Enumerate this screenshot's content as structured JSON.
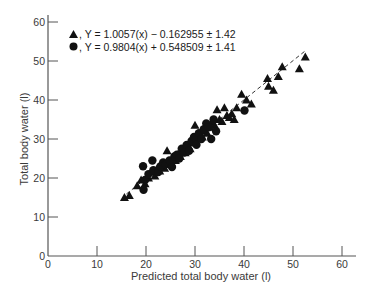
{
  "chart_data": {
    "type": "scatter",
    "title": "",
    "xlabel": "Predicted total body water (l)",
    "ylabel": "Total body water (l)",
    "xlim": [
      0,
      60
    ],
    "ylim": [
      0,
      60
    ],
    "xticks": [
      0,
      10,
      20,
      30,
      40,
      50,
      60
    ],
    "yticks": [
      0,
      10,
      20,
      30,
      40,
      50,
      60
    ],
    "grid": false,
    "legend_position": "upper-left",
    "colors": {
      "marker": "#111111",
      "axis": "#555555",
      "text": "#3a3a3a"
    },
    "series": [
      {
        "name": "Y = 1.0057(x) − 0.162955 ± 1.42",
        "marker": "triangle",
        "equation": {
          "slope": 1.0057,
          "intercept": -0.162955,
          "se": 1.42
        },
        "points": [
          [
            15.6,
            15.0
          ],
          [
            16.6,
            15.5
          ],
          [
            18.2,
            18.0
          ],
          [
            19.0,
            19.5
          ],
          [
            19.8,
            18.5
          ],
          [
            20.5,
            20.0
          ],
          [
            21.0,
            21.5
          ],
          [
            21.8,
            20.5
          ],
          [
            22.3,
            22.5
          ],
          [
            22.8,
            21.8
          ],
          [
            23.3,
            23.0
          ],
          [
            23.8,
            22.5
          ],
          [
            24.3,
            27.0
          ],
          [
            24.5,
            24.0
          ],
          [
            25.0,
            23.5
          ],
          [
            25.5,
            25.0
          ],
          [
            26.0,
            24.5
          ],
          [
            26.5,
            26.0
          ],
          [
            27.0,
            25.5
          ],
          [
            27.5,
            27.0
          ],
          [
            28.0,
            26.5
          ],
          [
            28.5,
            28.0
          ],
          [
            29.0,
            27.5
          ],
          [
            29.5,
            29.0
          ],
          [
            30.0,
            33.5
          ],
          [
            30.3,
            30.0
          ],
          [
            31.0,
            31.0
          ],
          [
            31.5,
            30.5
          ],
          [
            32.0,
            32.0
          ],
          [
            32.5,
            31.5
          ],
          [
            33.0,
            33.0
          ],
          [
            33.5,
            34.5
          ],
          [
            34.0,
            33.5
          ],
          [
            34.5,
            37.5
          ],
          [
            35.0,
            35.0
          ],
          [
            35.5,
            34.5
          ],
          [
            36.0,
            38.0
          ],
          [
            36.5,
            36.0
          ],
          [
            37.0,
            35.5
          ],
          [
            37.5,
            36.5
          ],
          [
            38.0,
            35.0
          ],
          [
            38.5,
            38.0
          ],
          [
            39.5,
            41.5
          ],
          [
            40.5,
            40.0
          ],
          [
            41.5,
            39.0
          ],
          [
            44.8,
            45.5
          ],
          [
            45.0,
            43.5
          ],
          [
            46.0,
            42.5
          ],
          [
            47.0,
            46.0
          ],
          [
            47.8,
            48.5
          ],
          [
            51.3,
            48.0
          ],
          [
            52.5,
            51.0
          ]
        ]
      },
      {
        "name": "Y = 0.9804(x) + 0.548509 ± 1.41",
        "marker": "circle",
        "equation": {
          "slope": 0.9804,
          "intercept": 0.548509,
          "se": 1.41
        },
        "points": [
          [
            19.4,
            23.0
          ],
          [
            21.3,
            24.5
          ],
          [
            19.5,
            17.0
          ],
          [
            19.8,
            19.5
          ],
          [
            20.5,
            21.0
          ],
          [
            21.5,
            22.0
          ],
          [
            22.5,
            21.5
          ],
          [
            23.0,
            23.0
          ],
          [
            23.5,
            24.0
          ],
          [
            24.0,
            23.5
          ],
          [
            24.8,
            24.5
          ],
          [
            25.3,
            22.8
          ],
          [
            25.8,
            25.5
          ],
          [
            26.3,
            26.0
          ],
          [
            26.8,
            25.0
          ],
          [
            27.3,
            27.5
          ],
          [
            27.8,
            26.5
          ],
          [
            28.3,
            28.5
          ],
          [
            28.8,
            27.0
          ],
          [
            29.3,
            29.5
          ],
          [
            29.8,
            30.5
          ],
          [
            30.3,
            28.5
          ],
          [
            30.8,
            31.5
          ],
          [
            31.3,
            30.0
          ],
          [
            31.8,
            32.5
          ],
          [
            32.3,
            34.0
          ],
          [
            32.8,
            33.0
          ],
          [
            33.3,
            30.0
          ],
          [
            33.8,
            35.0
          ],
          [
            34.3,
            32.0
          ],
          [
            40.1,
            37.3
          ]
        ]
      }
    ],
    "regression_line": {
      "style": "dashed",
      "from": [
        16,
        15.9
      ],
      "to": [
        52.5,
        52.6
      ]
    }
  },
  "legend": {
    "items": [
      {
        "symbol": "triangle",
        "label": ", Y = 1.0057(x) − 0.162955 ± 1.42"
      },
      {
        "symbol": "circle",
        "label": ", Y = 0.9804(x) + 0.548509 ± 1.41"
      }
    ]
  }
}
